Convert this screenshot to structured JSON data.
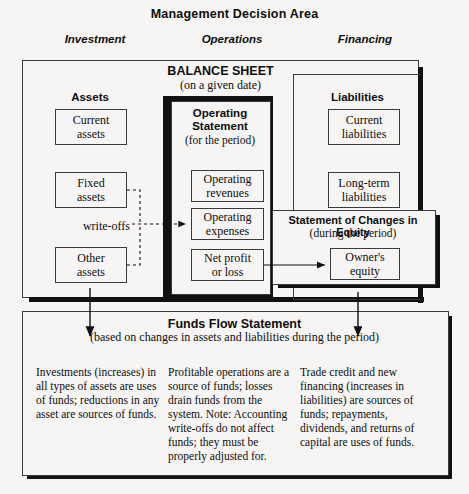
{
  "title": "Management Decision Area",
  "column_headers": {
    "investment": "Investment",
    "operations": "Operations",
    "financing": "Financing"
  },
  "balance_sheet": {
    "title": "BALANCE SHEET",
    "subtitle": "(on a given date)",
    "assets_label": "Assets",
    "liabilities_label": "Liabilities",
    "assets": [
      {
        "line1": "Current",
        "line2": "assets"
      },
      {
        "line1": "Fixed",
        "line2": "assets"
      },
      {
        "line1": "Other",
        "line2": "assets"
      }
    ],
    "liabilities": [
      {
        "line1": "Current",
        "line2": "liabilities"
      },
      {
        "line1": "Long-term",
        "line2": "liabilities"
      }
    ]
  },
  "operating_statement": {
    "title_line1": "Operating",
    "title_line2": "Statement",
    "subtitle": "(for the period)",
    "items": [
      {
        "line1": "Operating",
        "line2": "revenues"
      },
      {
        "line1": "Operating",
        "line2": "expenses"
      },
      {
        "line1": "Net profit",
        "line2": "or loss"
      }
    ]
  },
  "equity_statement": {
    "title": "Statement of Changes in Equity",
    "subtitle": "(during the period)",
    "item": {
      "line1": "Owner's",
      "line2": "equity"
    }
  },
  "connectors": {
    "write_offs_label": "write-offs"
  },
  "funds_flow": {
    "title": "Funds Flow Statement",
    "subtitle": "(based on changes in assets and liabilities during the period)",
    "columns": [
      "Investments (increases) in all types of assets are uses of funds; reductions in any asset are sources of funds.",
      "Profitable operations are a source of funds; losses drain funds from the system.  Note: Accounting write-offs do not affect funds; they must be properly adjusted for.",
      "Trade credit and new financing (increases in liabilities) are sources of funds; repayments, dividends, and returns of capital are uses of funds."
    ]
  },
  "colors": {
    "background": "#f6f5f3",
    "ink": "#111111",
    "line": "#3a3a3a"
  }
}
